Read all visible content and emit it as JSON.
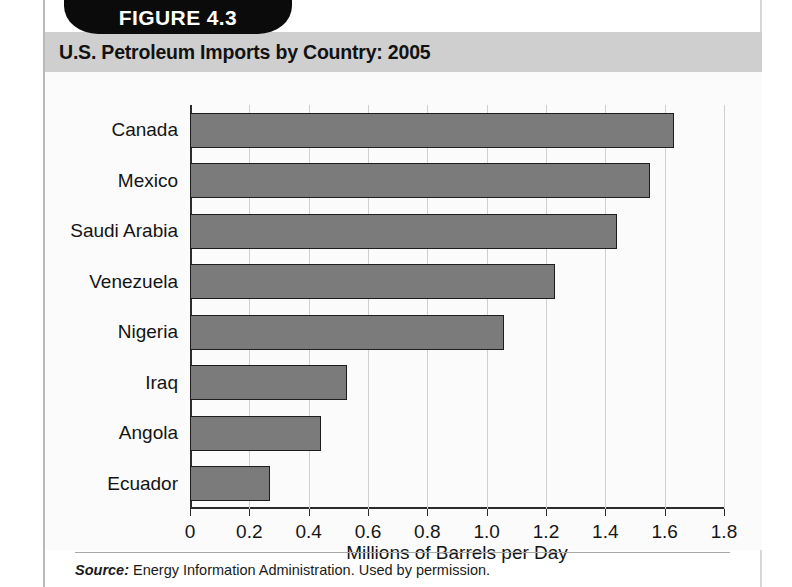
{
  "figure": {
    "tab_label": "FIGURE 4.3",
    "title": "U.S. Petroleum Imports by Country: 2005",
    "source_prefix": "Source:",
    "source_text": "Energy Information Administration. Used by permission.",
    "colors": {
      "tab_background": "#0b0b0b",
      "tab_text": "#ffffff",
      "title_band": "#cfcfcf",
      "bar_fill": "#7b7b7b",
      "bar_border": "#1d1d1d",
      "gridline": "#cfcfcf",
      "axis": "#2b2b2b",
      "plot_background": "#fbfbfb"
    }
  },
  "chart_data": {
    "type": "bar",
    "orientation": "horizontal",
    "title": "U.S. Petroleum Imports by Country: 2005",
    "xlabel": "Millions of Barrels per Day",
    "ylabel": "",
    "categories": [
      "Canada",
      "Mexico",
      "Saudi Arabia",
      "Venezuela",
      "Nigeria",
      "Iraq",
      "Angola",
      "Ecuador"
    ],
    "values": [
      1.63,
      1.55,
      1.44,
      1.23,
      1.06,
      0.53,
      0.44,
      0.27
    ],
    "xlim": [
      0,
      1.8
    ],
    "xticks": [
      0,
      0.2,
      0.4,
      0.6,
      0.8,
      1.0,
      1.2,
      1.4,
      1.6,
      1.8
    ],
    "xtick_labels": [
      "0",
      "0.2",
      "0.4",
      "0.6",
      "0.8",
      "1.0",
      "1.2",
      "1.4",
      "1.6",
      "1.8"
    ],
    "grid": "vertical",
    "legend": null
  }
}
